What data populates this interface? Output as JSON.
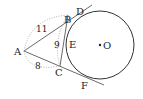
{
  "figure": {
    "type": "geometry-diagram",
    "points": {
      "A": {
        "label": "A",
        "x": 24,
        "y": 51
      },
      "B": {
        "label": "B",
        "x": 68,
        "y": 15
      },
      "C": {
        "label": "C",
        "x": 60,
        "y": 66
      },
      "D": {
        "label": "D",
        "x": 79,
        "y": 9
      },
      "E": {
        "label": "E",
        "x": 68,
        "y": 42
      },
      "F": {
        "label": "F",
        "x": 81,
        "y": 79
      },
      "O": {
        "label": "O",
        "x": 100,
        "y": 45
      }
    },
    "circle": {
      "center": "O",
      "cx": 100,
      "cy": 45,
      "r": 34
    },
    "lengths": {
      "AB": "11",
      "AC": "8",
      "BC": "9"
    },
    "colors": {
      "stroke": "#333333",
      "dotted": "#999999",
      "text": "#222222"
    }
  }
}
